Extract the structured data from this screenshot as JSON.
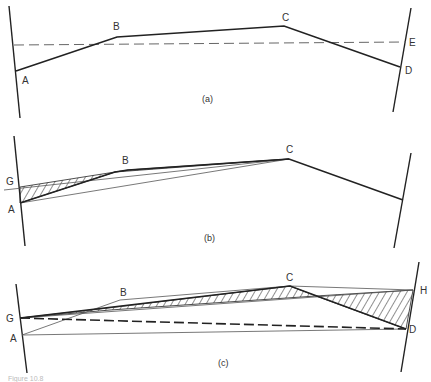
{
  "figure": {
    "caption": "Figure 10.8",
    "panels": [
      {
        "id": "a",
        "label": "(a)",
        "points": {
          "A": "A",
          "B": "B",
          "C": "C",
          "D": "D",
          "E": "E"
        }
      },
      {
        "id": "b",
        "label": "(b)",
        "points": {
          "G": "G",
          "A": "A",
          "B": "B",
          "C": "C"
        }
      },
      {
        "id": "c",
        "label": "(c)",
        "points": {
          "G": "G",
          "A": "A",
          "B": "B",
          "C": "C",
          "D": "D",
          "H": "H"
        }
      }
    ]
  }
}
